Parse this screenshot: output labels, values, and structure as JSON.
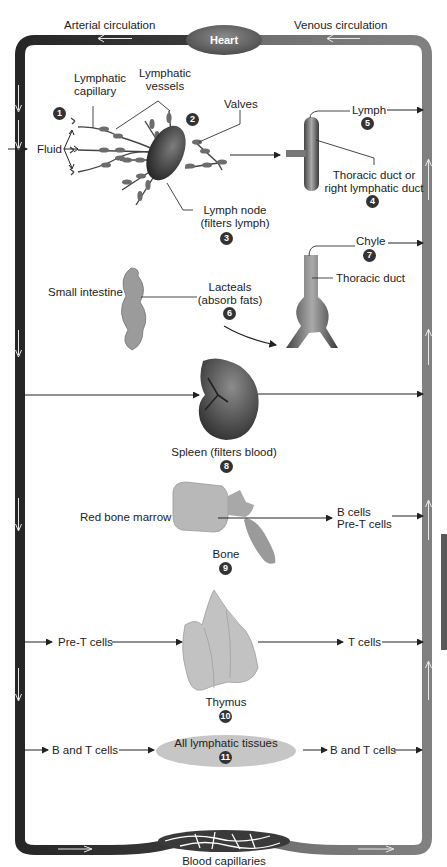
{
  "header": {
    "arterial_label": "Arterial circulation",
    "venous_label": "Venous circulation",
    "heart_label": "Heart"
  },
  "steps": [
    {
      "number": "1",
      "labels": {
        "fluid": "Fluid",
        "capillary_line1": "Lymphatic",
        "capillary_line2": "capillary"
      }
    },
    {
      "number": "2",
      "labels": {
        "vessels_line1": "Lymphatic",
        "vessels_line2": "vessels",
        "valves": "Valves"
      }
    },
    {
      "number": "3",
      "labels": {
        "line1": "Lymph node",
        "line2": "(filters lymph)"
      }
    },
    {
      "number": "4",
      "labels": {
        "line1": "Thoracic duct or",
        "line2": "right lymphatic duct"
      }
    },
    {
      "number": "5",
      "labels": {
        "line1": "Lymph"
      }
    },
    {
      "number": "6",
      "labels": {
        "line1": "Lacteals",
        "line2": "(absorb fats)",
        "source": "Small intestine"
      }
    },
    {
      "number": "7",
      "labels": {
        "line1": "Chyle",
        "duct": "Thoracic duct"
      }
    },
    {
      "number": "8",
      "labels": {
        "line1": "Spleen (filters blood)"
      }
    },
    {
      "number": "9",
      "labels": {
        "line1": "Bone",
        "source": "Red bone marrow",
        "out1": "B cells",
        "out2": "Pre-T cells"
      }
    },
    {
      "number": "10",
      "labels": {
        "line1": "Thymus",
        "in": "Pre-T cells",
        "out": "T cells"
      }
    },
    {
      "number": "11",
      "labels": {
        "line1": "All lymphatic tissues",
        "in": "B and T cells",
        "out": "B and T cells"
      }
    }
  ],
  "footer": {
    "capillaries_label": "Blood capillaries"
  },
  "colors": {
    "arterial": "#2e2e2e",
    "venous": "#7a7a7a",
    "heart": "#6b6b6b",
    "tissue_ellipse": "#c4c4c4",
    "organ": "#4a4a4a",
    "number_badge": "#333333"
  }
}
